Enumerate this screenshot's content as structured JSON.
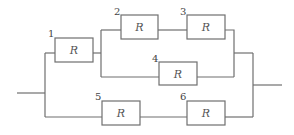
{
  "diagram": {
    "type": "circuit",
    "resistor_symbol": "R",
    "resistors": [
      {
        "number": "1",
        "label": "R",
        "x": 55,
        "y": 38,
        "w": 38,
        "h": 24
      },
      {
        "number": "2",
        "label": "R",
        "x": 121,
        "y": 15,
        "w": 37,
        "h": 24
      },
      {
        "number": "3",
        "label": "R",
        "x": 187,
        "y": 15,
        "w": 38,
        "h": 24
      },
      {
        "number": "4",
        "label": "R",
        "x": 159,
        "y": 62,
        "w": 38,
        "h": 23
      },
      {
        "number": "5",
        "label": "R",
        "x": 102,
        "y": 101,
        "w": 38,
        "h": 24
      },
      {
        "number": "6",
        "label": "R",
        "x": 187,
        "y": 101,
        "w": 38,
        "h": 24
      }
    ],
    "colors": {
      "line": "#6f6f6f",
      "text": "#555555",
      "background": "#ffffff"
    }
  }
}
